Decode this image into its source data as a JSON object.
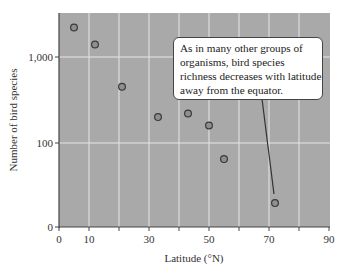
{
  "chart_data": {
    "type": "scatter",
    "title": "",
    "xlabel": "Latitude (°N)",
    "ylabel": "Number of bird species",
    "xlim": [
      0,
      90
    ],
    "ylim_scale": "log-like (0, 100, 1,000)",
    "x_ticks": [
      0,
      10,
      20,
      30,
      40,
      50,
      60,
      70,
      80,
      90
    ],
    "x_tick_labels": [
      "0",
      "10",
      "",
      "30",
      "",
      "50",
      "",
      "70",
      "",
      "90"
    ],
    "y_ticks": [
      0,
      100,
      1000
    ],
    "y_tick_labels": [
      "0",
      "100",
      "1,000"
    ],
    "grid": true,
    "points": [
      {
        "x": 5,
        "y": 2200
      },
      {
        "x": 12,
        "y": 1400
      },
      {
        "x": 21,
        "y": 450
      },
      {
        "x": 33,
        "y": 200
      },
      {
        "x": 43,
        "y": 220
      },
      {
        "x": 50,
        "y": 160
      },
      {
        "x": 55,
        "y": 65
      },
      {
        "x": 72,
        "y": 20
      }
    ],
    "annotation": {
      "text": "As in many other groups of organisms, bird species richness decreases with latitude away from the equator.",
      "lines": [
        "As in many other groups of",
        "organisms, bird species",
        "richness decreases with latitude",
        "away from the equator."
      ],
      "points_to": {
        "x": 72,
        "y": 20
      }
    },
    "colors": {
      "plot_background": "#a9a9a9",
      "grid": "#e6e6e6",
      "marker_fill": "#8f8f8f",
      "marker_edge": "#3a3a3a"
    }
  }
}
